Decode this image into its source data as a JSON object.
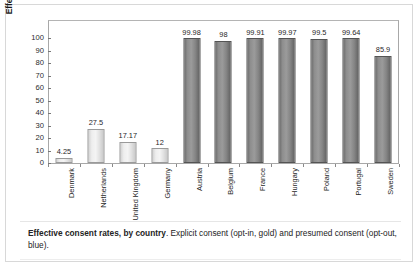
{
  "figure": {
    "caption_bold": "Effective consent rates, by country",
    "caption_rest": ". Explicit consent (opt-in, gold) and presumed consent (opt-out, blue)."
  },
  "chart_data": {
    "type": "bar",
    "title": "",
    "xlabel": "",
    "ylabel": "Effective consent percentage",
    "ylim": [
      0,
      100
    ],
    "yticks": [
      0,
      10,
      20,
      30,
      40,
      50,
      60,
      70,
      80,
      90,
      100
    ],
    "ytick_labels": [
      "0",
      "10",
      "20",
      "30",
      "40",
      "50",
      "60",
      "70",
      "80",
      "90",
      "100"
    ],
    "grid": false,
    "legend": null,
    "categories": [
      "Denmark",
      "Netherlands",
      "United Kingdom",
      "Germany",
      "Austria",
      "Belgium",
      "France",
      "Hungary",
      "Poland",
      "Portugal",
      "Sweden"
    ],
    "values": [
      4.25,
      27.5,
      17.17,
      12,
      99.98,
      98,
      99.91,
      99.97,
      99.5,
      99.64,
      85.9
    ],
    "value_labels": [
      "4.25",
      "27.5",
      "17.17",
      "12",
      "99.98",
      "98",
      "99.91",
      "99.97",
      "99.5",
      "99.64",
      "85.9"
    ],
    "groups": [
      "gold",
      "gold",
      "gold",
      "gold",
      "blue",
      "blue",
      "blue",
      "blue",
      "blue",
      "blue",
      "blue"
    ],
    "group_names": {
      "gold": "Explicit consent (opt-in)",
      "blue": "Presumed consent (opt-out)"
    },
    "colors": {
      "gold": "#f0f0f0",
      "blue": "#8b8b8b",
      "axis": "#a8a8a8",
      "text": "#1f1f1f"
    }
  }
}
